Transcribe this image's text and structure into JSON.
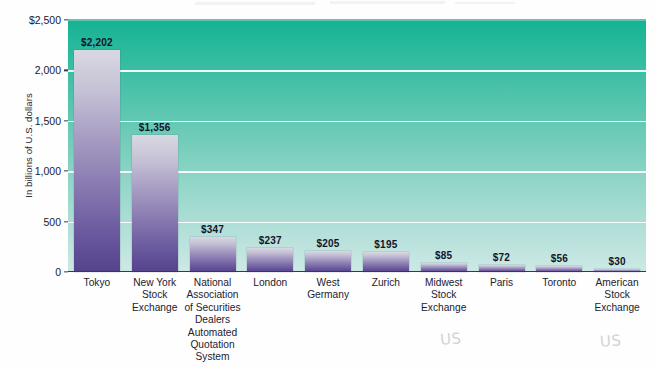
{
  "chart_data": {
    "type": "bar",
    "title": "",
    "xlabel": "",
    "ylabel": "In billions of U.S. dollars",
    "ylim": [
      0,
      2500
    ],
    "yticks": [
      0,
      500,
      1000,
      1500,
      2000,
      2500
    ],
    "ytick_labels": [
      "0",
      "500",
      "1,000",
      "1,500",
      "2,000",
      "$2,500"
    ],
    "gridlines": [
      500,
      1000,
      1500,
      2000
    ],
    "grid": true,
    "legend": "none",
    "categories": [
      "Tokyo",
      "New York Stock Exchange",
      "National Association of Securities Dealers Automated Quotation System",
      "London",
      "West Germany",
      "Zurich",
      "Midwest Stock Exchange",
      "Paris",
      "Toronto",
      "American Stock Exchange"
    ],
    "values": [
      2202,
      1356,
      347,
      237,
      205,
      195,
      85,
      72,
      56,
      30
    ],
    "value_labels": [
      "$2,202",
      "$1,356",
      "$347",
      "$237",
      "$205",
      "$195",
      "$85",
      "$72",
      "$56",
      "$30"
    ]
  },
  "bars": [
    {
      "label": "Tokyo",
      "label_lines": [
        "Tokyo"
      ],
      "value": 2202,
      "value_label": "$2,202"
    },
    {
      "label": "New York Stock Exchange",
      "label_lines": [
        "New York",
        "Stock",
        "Exchange"
      ],
      "value": 1356,
      "value_label": "$1,356"
    },
    {
      "label": "National Association of Securities Dealers Automated Quotation System",
      "label_lines": [
        "National",
        "Association",
        "of Securities",
        "Dealers",
        "Automated",
        "Quotation",
        "System"
      ],
      "value": 347,
      "value_label": "$347"
    },
    {
      "label": "London",
      "label_lines": [
        "London"
      ],
      "value": 237,
      "value_label": "$237"
    },
    {
      "label": "West Germany",
      "label_lines": [
        "West",
        "Germany"
      ],
      "value": 205,
      "value_label": "$205"
    },
    {
      "label": "Zurich",
      "label_lines": [
        "Zurich"
      ],
      "value": 195,
      "value_label": "$195"
    },
    {
      "label": "Midwest Stock Exchange",
      "label_lines": [
        "Midwest",
        "Stock",
        "Exchange"
      ],
      "value": 85,
      "value_label": "$85"
    },
    {
      "label": "Paris",
      "label_lines": [
        "Paris"
      ],
      "value": 72,
      "value_label": "$72"
    },
    {
      "label": "Toronto",
      "label_lines": [
        "Toronto"
      ],
      "value": 56,
      "value_label": "$56"
    },
    {
      "label": "American Stock Exchange",
      "label_lines": [
        "American",
        "Stock",
        "Exchange"
      ],
      "value": 30,
      "value_label": "$30"
    }
  ],
  "annotations": [
    {
      "text": "US",
      "kind": "handwritten-pencil"
    },
    {
      "text": "US",
      "kind": "handwritten-pencil"
    }
  ],
  "colors": {
    "plot_background_top": "#15b393",
    "plot_background_bottom": "#cde9e5",
    "bar_top": "#d8d8e2",
    "bar_bottom": "#55438c",
    "gridline": "#ffffff",
    "axis": "#3a3a44",
    "text": "#20202c",
    "page_background": "#ffffff",
    "pencil": "#d3d3d6"
  }
}
